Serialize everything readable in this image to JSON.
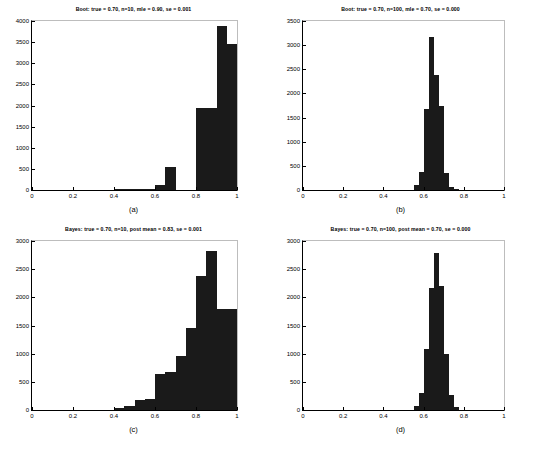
{
  "figure": {
    "background": "#ffffff",
    "bar_color": "#1a1a1a",
    "axis_color": "#000000"
  },
  "panels": [
    {
      "id": "a",
      "caption": "(a)",
      "title": "Boot: true = 0.70, n=10, mle = 0.90, se = 0.001",
      "chart_data": {
        "type": "bar",
        "title": "Boot: true = 0.70, n=10, mle = 0.90, se = 0.001",
        "xlabel": "",
        "ylabel": "",
        "xlim": [
          0,
          1
        ],
        "ylim": [
          0,
          4000
        ],
        "grid": false,
        "legend": null,
        "xticks": [
          "0",
          "0.2",
          "0.4",
          "0.6",
          "0.8",
          "1"
        ],
        "xtick_values": [
          0,
          0.2,
          0.4,
          0.6,
          0.8,
          1
        ],
        "yticks": [
          "0",
          "500",
          "1000",
          "1500",
          "2000",
          "2500",
          "3000",
          "3500",
          "4000"
        ],
        "ytick_values": [
          0,
          500,
          1000,
          1500,
          2000,
          2500,
          3000,
          3500,
          4000
        ],
        "bin_edges": [
          0.4,
          0.45,
          0.5,
          0.55,
          0.6,
          0.65,
          0.7,
          0.75,
          0.8,
          0.9,
          0.95,
          1.0
        ],
        "values": [
          10,
          20,
          10,
          10,
          120,
          540,
          0,
          0,
          1930,
          3880,
          3460
        ]
      }
    },
    {
      "id": "b",
      "caption": "(b)",
      "title": "Boot: true = 0.70, n=100, mle = 0.70, se = 0.000",
      "chart_data": {
        "type": "bar",
        "title": "Boot: true = 0.70, n=100, mle = 0.70, se = 0.000",
        "xlabel": "",
        "ylabel": "",
        "xlim": [
          0,
          1
        ],
        "ylim": [
          0,
          3500
        ],
        "grid": false,
        "legend": null,
        "xticks": [
          "0",
          "0.2",
          "0.4",
          "0.6",
          "0.8",
          "1"
        ],
        "xtick_values": [
          0,
          0.2,
          0.4,
          0.6,
          0.8,
          1
        ],
        "yticks": [
          "0",
          "500",
          "1000",
          "1500",
          "2000",
          "2500",
          "3000",
          "3500"
        ],
        "ytick_values": [
          0,
          500,
          1000,
          1500,
          2000,
          2500,
          3000,
          3500
        ],
        "bin_edges": [
          0.55,
          0.575,
          0.6,
          0.625,
          0.65,
          0.675,
          0.7,
          0.725,
          0.75,
          0.775
        ],
        "values": [
          100,
          370,
          1670,
          3160,
          2390,
          1740,
          360,
          60,
          15
        ]
      }
    },
    {
      "id": "c",
      "caption": "(c)",
      "title": "Bayes: true = 0.70, n=10, post mean = 0.83, se = 0.001",
      "chart_data": {
        "type": "bar",
        "title": "Bayes: true = 0.70, n=10, post mean = 0.83, se = 0.001",
        "xlabel": "",
        "ylabel": "",
        "xlim": [
          0,
          1
        ],
        "ylim": [
          0,
          3000
        ],
        "grid": false,
        "legend": null,
        "xticks": [
          "0",
          "0.2",
          "0.4",
          "0.6",
          "0.8",
          "1"
        ],
        "xtick_values": [
          0,
          0.2,
          0.4,
          0.6,
          0.8,
          1
        ],
        "yticks": [
          "0",
          "500",
          "1000",
          "1500",
          "2000",
          "2500",
          "3000"
        ],
        "ytick_values": [
          0,
          500,
          1000,
          1500,
          2000,
          2500,
          3000
        ],
        "bin_edges": [
          0.4,
          0.45,
          0.5,
          0.55,
          0.6,
          0.65,
          0.7,
          0.75,
          0.8,
          0.85,
          0.9,
          1.0
        ],
        "values": [
          30,
          80,
          180,
          200,
          640,
          680,
          950,
          1450,
          2380,
          2820,
          1790
        ]
      }
    },
    {
      "id": "d",
      "caption": "(d)",
      "title": "Bayes: true = 0.70, n=100, post mean = 0.70, se = 0.000",
      "chart_data": {
        "type": "bar",
        "title": "Bayes: true = 0.70, n=100, post mean = 0.70, se = 0.000",
        "xlabel": "",
        "ylabel": "",
        "xlim": [
          0,
          1
        ],
        "ylim": [
          0,
          3000
        ],
        "grid": false,
        "legend": null,
        "xticks": [
          "0",
          "0.2",
          "0.4",
          "0.6",
          "0.8",
          "1"
        ],
        "xtick_values": [
          0,
          0.2,
          0.4,
          0.6,
          0.8,
          1
        ],
        "yticks": [
          "0",
          "500",
          "1000",
          "1500",
          "2000",
          "2500",
          "3000"
        ],
        "ytick_values": [
          0,
          500,
          1000,
          1500,
          2000,
          2500,
          3000
        ],
        "bin_edges": [
          0.55,
          0.575,
          0.6,
          0.625,
          0.65,
          0.675,
          0.7,
          0.725,
          0.75,
          0.775
        ],
        "values": [
          70,
          300,
          1080,
          2160,
          2790,
          2210,
          990,
          260,
          50
        ]
      }
    }
  ]
}
